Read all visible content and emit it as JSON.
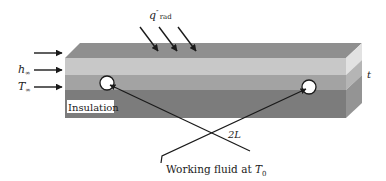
{
  "diagram": {
    "labels": {
      "q_main": "q",
      "q_prime": "″",
      "q_sub": "rad",
      "h_main": "h",
      "h_sub": "∞",
      "T_main": "T",
      "T_sub": "∞",
      "thickness": "t",
      "insulation": "Insulation",
      "spacing": "2L",
      "working_fluid_prefix": "Working fluid at ",
      "working_fluid_T": "T",
      "working_fluid_sub": "0"
    },
    "colors": {
      "top_face": "#8f8f8f",
      "layer_light": "#c8c8c8",
      "layer_mid": "#a3a3a3",
      "layer_dark": "#7c7c7c",
      "side_top": "#d8d8d8",
      "side_light": "#e0e0e0",
      "side_mid": "#b5b5b5",
      "side_dark": "#949494",
      "line": "#1a1a1a"
    }
  }
}
